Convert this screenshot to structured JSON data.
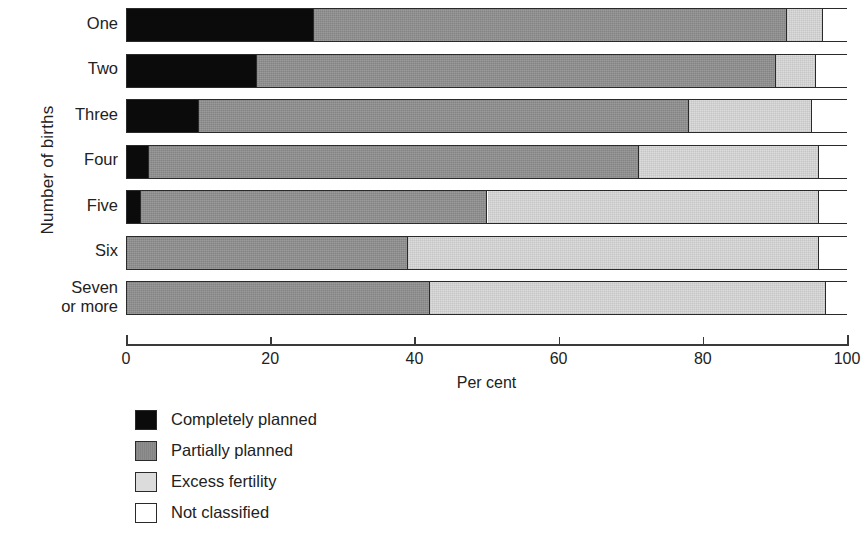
{
  "chart_data": {
    "type": "bar",
    "orientation": "horizontal",
    "stacked": true,
    "title": "",
    "xlabel": "Per cent",
    "ylabel": "Number of births",
    "xlim": [
      0,
      100
    ],
    "xticks": [
      0,
      20,
      40,
      60,
      80,
      100
    ],
    "xtick_labels": [
      "0",
      "20",
      "40",
      "60",
      "80",
      "100"
    ],
    "grid": false,
    "legend_position": "below-left",
    "categories": [
      "One",
      "Two",
      "Three",
      "Four",
      "Five",
      "Six",
      "Seven or more"
    ],
    "category_labels_multiline": [
      [
        "One"
      ],
      [
        "Two"
      ],
      [
        "Three"
      ],
      [
        "Four"
      ],
      [
        "Five"
      ],
      [
        "Six"
      ],
      [
        "Seven",
        "or more"
      ]
    ],
    "series": [
      {
        "name": "Completely planned",
        "color": "#0b0b0b",
        "values": [
          26,
          18,
          10,
          3,
          2,
          0,
          0
        ]
      },
      {
        "name": "Partially planned",
        "color": "#8e8e8e",
        "values": [
          65.5,
          72,
          68,
          68,
          48,
          39,
          42
        ]
      },
      {
        "name": "Excess fertility",
        "color": "#dcdcdc",
        "values": [
          5,
          5.5,
          17,
          25,
          46,
          57,
          55
        ]
      },
      {
        "name": "Not classified",
        "color": "#ffffff",
        "values": [
          3.5,
          4.5,
          5,
          4,
          4,
          4,
          3
        ]
      }
    ],
    "cumulative_boundaries": [
      [
        26,
        91.5,
        96.5,
        100
      ],
      [
        18,
        90,
        95.5,
        100
      ],
      [
        10,
        78,
        95,
        100
      ],
      [
        3,
        71,
        96,
        100
      ],
      [
        2,
        50,
        96,
        100
      ],
      [
        0,
        39,
        96,
        100
      ],
      [
        0,
        42,
        97,
        100
      ]
    ]
  },
  "axes": {
    "y_title": "Number of births",
    "x_title": "Per cent",
    "x_ticks": [
      "0",
      "20",
      "40",
      "60",
      "80",
      "100"
    ],
    "categories": [
      {
        "line1": "One",
        "line2": ""
      },
      {
        "line1": "Two",
        "line2": ""
      },
      {
        "line1": "Three",
        "line2": ""
      },
      {
        "line1": "Four",
        "line2": ""
      },
      {
        "line1": "Five",
        "line2": ""
      },
      {
        "line1": "Six",
        "line2": ""
      },
      {
        "line1": "Seven",
        "line2": "or more"
      }
    ]
  },
  "legend": {
    "items": [
      {
        "label": "Completely planned",
        "swatch": "completely"
      },
      {
        "label": "Partially  planned",
        "swatch": "partially"
      },
      {
        "label": "Excess fertility",
        "swatch": "excess"
      },
      {
        "label": "Not classified",
        "swatch": "notclass"
      }
    ]
  },
  "colors": {
    "completely_planned": "#0b0b0b",
    "partially_planned": "#8e8e8e",
    "excess_fertility": "#dcdcdc",
    "not_classified": "#ffffff",
    "outline": "#2a2a2a"
  }
}
